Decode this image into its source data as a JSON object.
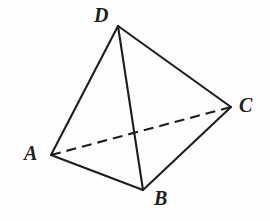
{
  "figure": {
    "background_color": "#fefefe",
    "stroke_color": "#1d1d1d",
    "stroke_width": 2.1,
    "width": 270,
    "height": 221,
    "vertices": [
      {
        "name": "A",
        "label": "A",
        "x": 51,
        "y": 155,
        "label_x": 24,
        "label_y": 143
      },
      {
        "name": "B",
        "label": "B",
        "x": 143,
        "y": 190,
        "label_x": 154,
        "label_y": 188
      },
      {
        "name": "C",
        "label": "C",
        "x": 231,
        "y": 107,
        "label_x": 239,
        "label_y": 95
      },
      {
        "name": "D",
        "label": "D",
        "x": 118,
        "y": 26,
        "label_x": 94,
        "label_y": 5
      }
    ],
    "edges": [
      {
        "name": "edge-AD",
        "from": "A",
        "to": "D",
        "style": "solid",
        "hidden": false
      },
      {
        "name": "edge-DC",
        "from": "D",
        "to": "C",
        "style": "solid",
        "hidden": false
      },
      {
        "name": "edge-DB",
        "from": "D",
        "to": "B",
        "style": "solid",
        "hidden": false
      },
      {
        "name": "edge-AB",
        "from": "A",
        "to": "B",
        "style": "solid",
        "hidden": false
      },
      {
        "name": "edge-BC",
        "from": "B",
        "to": "C",
        "style": "solid",
        "hidden": false
      },
      {
        "name": "edge-AC",
        "from": "A",
        "to": "C",
        "style": "dashed",
        "hidden": true,
        "dash_pattern": "10 6"
      }
    ]
  }
}
